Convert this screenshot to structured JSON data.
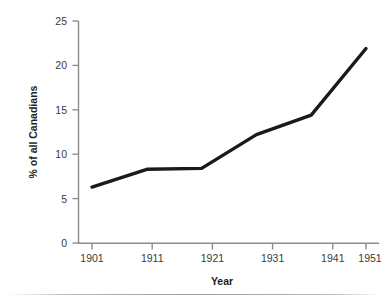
{
  "chart_data": {
    "type": "line",
    "title": "",
    "subtitle": "",
    "xlabel": "Year",
    "ylabel": "% of all Canadians",
    "categories": [
      "1901",
      "1911",
      "1921",
      "1931",
      "1941",
      "1951"
    ],
    "x": [
      1901,
      1911,
      1921,
      1931,
      1941,
      1951
    ],
    "values": [
      6.3,
      8.3,
      8.4,
      12.2,
      14.4,
      21.9
    ],
    "series": [
      {
        "name": "% of all Canadians",
        "values": [
          6.3,
          8.3,
          8.4,
          12.2,
          14.4,
          21.9
        ]
      }
    ],
    "xlim": [
      1901,
      1951
    ],
    "ylim": [
      0,
      25
    ],
    "yticks": [
      "0",
      "5",
      "10",
      "15",
      "20",
      "25"
    ],
    "ytick_values": [
      0,
      5,
      10,
      15,
      20,
      25
    ],
    "xticks": [
      "1901",
      "1911",
      "1921",
      "1931",
      "1941",
      "1951"
    ],
    "grid": false,
    "legend": false,
    "legend_position": "none",
    "line_color": "#1a1a1a",
    "axis_color": "#8c8c8c",
    "text_color": "#3b3b3b",
    "background": "#ffffff",
    "line_width": 3.4,
    "markers": false,
    "annotations": []
  },
  "axes": {
    "y": {
      "label": "% of all Canadians",
      "ticks": [
        {
          "label": "25",
          "value": 25
        },
        {
          "label": "20",
          "value": 20
        },
        {
          "label": "15",
          "value": 15
        },
        {
          "label": "10",
          "value": 10
        },
        {
          "label": "5",
          "value": 5
        },
        {
          "label": "0",
          "value": 0
        }
      ]
    },
    "x": {
      "label": "Year",
      "ticks": [
        {
          "label": "1901",
          "value": 1901
        },
        {
          "label": "1911",
          "value": 1911
        },
        {
          "label": "1921",
          "value": 1921
        },
        {
          "label": "1931",
          "value": 1931
        },
        {
          "label": "1941",
          "value": 1941
        },
        {
          "label": "1951",
          "value": 1951
        }
      ]
    }
  }
}
